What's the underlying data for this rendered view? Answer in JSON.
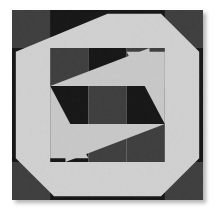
{
  "image": {
    "kind": "quilt-block-photograph",
    "title": "Pieced quilt block",
    "canvas": {
      "width": 214,
      "height": 211,
      "background": "#ffffff"
    },
    "block": {
      "left": 12,
      "top": 10,
      "width": 191,
      "height": 190
    },
    "shadow": {
      "offset_x": 3,
      "offset_y": 3,
      "blur": 4,
      "color": "rgba(0,0,0,0.30)"
    }
  },
  "palette": {
    "black": "#0b0b0b",
    "near_black": "#141414",
    "dark_gray": "#3a3a3a",
    "mid_dark_gray": "#3f3f3f",
    "center_gray": "#3a3a3a",
    "light": "#e6e6e6",
    "light_alt": "#dcdcdc",
    "mottle_dark": "#2a2a2a",
    "mottle_light": "#cfcfcf",
    "background": "#ffffff"
  },
  "geometry": {
    "viewbox": "0 0 100 100",
    "grid_note": "5x5 outer grid; inner 3x3 occupies rows/cols 1-4 (20..80)",
    "outer_cell": 20,
    "inner_start": 20,
    "inner_end": 80,
    "octagon_points": "50,0 80,0 100,20 100,80 80,100 20,100 0,80 0,20",
    "octagon_inner_points": "50,8 76,8 92,24 92,76 76,92 24,92 8,76 8,24"
  },
  "regions": {
    "corners": [
      {
        "name": "corner-top-left",
        "tone": "dark_gray"
      },
      {
        "name": "corner-top-right",
        "tone": "dark_gray"
      },
      {
        "name": "corner-bottom-left",
        "tone": "dark_gray"
      },
      {
        "name": "corner-bottom-right",
        "tone": "dark_gray"
      }
    ],
    "edges": [
      {
        "name": "edge-top",
        "tone": "black"
      },
      {
        "name": "edge-right",
        "tone": "black"
      },
      {
        "name": "edge-bottom",
        "tone": "black"
      },
      {
        "name": "edge-left",
        "tone": "black"
      }
    ],
    "ring": {
      "name": "octagon-ring",
      "tone": "light"
    },
    "inner_grid": [
      {
        "name": "inner-cell-top-left",
        "tone": "dark_gray"
      },
      {
        "name": "inner-cell-top-center",
        "tone": "black"
      },
      {
        "name": "inner-cell-top-right",
        "tone": "dark_gray"
      },
      {
        "name": "inner-cell-mid-left",
        "tone": "black"
      },
      {
        "name": "inner-cell-center",
        "tone": "center_gray"
      },
      {
        "name": "inner-cell-mid-right",
        "tone": "black"
      },
      {
        "name": "inner-cell-bottom-left",
        "tone": "black"
      },
      {
        "name": "inner-cell-bottom-center",
        "tone": "dark_gray"
      },
      {
        "name": "inner-cell-bottom-right",
        "tone": "dark_gray"
      }
    ],
    "pinwheel": [
      {
        "name": "pinwheel-triangle-top",
        "tone": "light"
      },
      {
        "name": "pinwheel-triangle-right",
        "tone": "light"
      },
      {
        "name": "pinwheel-triangle-bottom",
        "tone": "light"
      },
      {
        "name": "pinwheel-triangle-left",
        "tone": "light"
      }
    ]
  },
  "chart_data": {
    "type": "heatmap",
    "xlabel": "",
    "ylabel": "",
    "categories": [
      "c1",
      "c2",
      "c3",
      "c4",
      "c5"
    ],
    "rows": [
      "r1",
      "r2",
      "r3",
      "r4",
      "r5"
    ],
    "legend": [
      "black",
      "dark gray",
      "light"
    ],
    "values": [
      [
        "dark_gray",
        "black",
        "black",
        "black",
        "dark_gray"
      ],
      [
        "black",
        "dark_gray",
        "black",
        "dark_gray",
        "black"
      ],
      [
        "black",
        "black",
        "center_gray",
        "black",
        "black"
      ],
      [
        "black",
        "black",
        "dark_gray",
        "dark_gray",
        "black"
      ],
      [
        "dark_gray",
        "black",
        "black",
        "black",
        "dark_gray"
      ]
    ],
    "grid": false,
    "legend_position": "none"
  }
}
